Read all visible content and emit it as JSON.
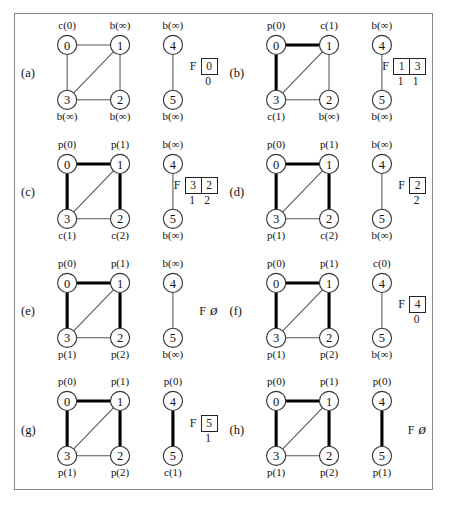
{
  "figure": {
    "caption": "",
    "panels": [
      {
        "tag": "(a)",
        "main_component": {
          "nodes": [
            {
              "id": "0",
              "label": "0",
              "state": "c(0)",
              "state_pos": "top"
            },
            {
              "id": "1",
              "label": "1",
              "state": "b(∞)",
              "state_pos": "top"
            },
            {
              "id": "3",
              "label": "3",
              "state": "b(∞)",
              "state_pos": "bottom"
            },
            {
              "id": "2",
              "label": "2",
              "state": "b(∞)",
              "state_pos": "bottom"
            }
          ],
          "edges": [
            {
              "from": "0",
              "to": "1",
              "bold": false
            },
            {
              "from": "0",
              "to": "3",
              "bold": false
            },
            {
              "from": "1",
              "to": "3",
              "bold": false
            },
            {
              "from": "1",
              "to": "2",
              "bold": false
            },
            {
              "from": "3",
              "to": "2",
              "bold": false
            }
          ]
        },
        "second_component": {
          "nodes": [
            {
              "id": "4",
              "label": "4",
              "state": "b(∞)",
              "state_pos": "top"
            },
            {
              "id": "5",
              "label": "5",
              "state": "b(∞)",
              "state_pos": "bottom"
            }
          ],
          "edges": [
            {
              "from": "4",
              "to": "5",
              "bold": false
            }
          ]
        },
        "queue": {
          "letter": "F",
          "empty": false,
          "cells": [
            "0"
          ],
          "sub": [
            "0"
          ]
        }
      },
      {
        "tag": "(b)",
        "main_component": {
          "nodes": [
            {
              "id": "0",
              "label": "0",
              "state": "p(0)",
              "state_pos": "top"
            },
            {
              "id": "1",
              "label": "1",
              "state": "c(1)",
              "state_pos": "top"
            },
            {
              "id": "3",
              "label": "3",
              "state": "c(1)",
              "state_pos": "bottom"
            },
            {
              "id": "2",
              "label": "2",
              "state": "b(∞)",
              "state_pos": "bottom"
            }
          ],
          "edges": [
            {
              "from": "0",
              "to": "1",
              "bold": true
            },
            {
              "from": "0",
              "to": "3",
              "bold": true
            },
            {
              "from": "1",
              "to": "3",
              "bold": false
            },
            {
              "from": "1",
              "to": "2",
              "bold": false
            },
            {
              "from": "3",
              "to": "2",
              "bold": false
            }
          ]
        },
        "second_component": {
          "nodes": [
            {
              "id": "4",
              "label": "4",
              "state": "b(∞)",
              "state_pos": "top"
            },
            {
              "id": "5",
              "label": "5",
              "state": "b(∞)",
              "state_pos": "bottom"
            }
          ],
          "edges": [
            {
              "from": "4",
              "to": "5",
              "bold": false
            }
          ]
        },
        "queue": {
          "letter": "F",
          "empty": false,
          "cells": [
            "1",
            "3"
          ],
          "sub": [
            "1",
            "1"
          ]
        }
      },
      {
        "tag": "(c)",
        "main_component": {
          "nodes": [
            {
              "id": "0",
              "label": "0",
              "state": "p(0)",
              "state_pos": "top"
            },
            {
              "id": "1",
              "label": "1",
              "state": "p(1)",
              "state_pos": "top"
            },
            {
              "id": "3",
              "label": "3",
              "state": "c(1)",
              "state_pos": "bottom"
            },
            {
              "id": "2",
              "label": "2",
              "state": "c(2)",
              "state_pos": "bottom"
            }
          ],
          "edges": [
            {
              "from": "0",
              "to": "1",
              "bold": true
            },
            {
              "from": "0",
              "to": "3",
              "bold": true
            },
            {
              "from": "1",
              "to": "3",
              "bold": false
            },
            {
              "from": "1",
              "to": "2",
              "bold": true
            },
            {
              "from": "3",
              "to": "2",
              "bold": false
            }
          ]
        },
        "second_component": {
          "nodes": [
            {
              "id": "4",
              "label": "4",
              "state": "b(∞)",
              "state_pos": "top"
            },
            {
              "id": "5",
              "label": "5",
              "state": "b(∞)",
              "state_pos": "bottom"
            }
          ],
          "edges": [
            {
              "from": "4",
              "to": "5",
              "bold": false
            }
          ]
        },
        "queue": {
          "letter": "F",
          "empty": false,
          "cells": [
            "3",
            "2"
          ],
          "sub": [
            "1",
            "2"
          ]
        }
      },
      {
        "tag": "(d)",
        "main_component": {
          "nodes": [
            {
              "id": "0",
              "label": "0",
              "state": "p(0)",
              "state_pos": "top"
            },
            {
              "id": "1",
              "label": "1",
              "state": "p(1)",
              "state_pos": "top"
            },
            {
              "id": "3",
              "label": "3",
              "state": "p(1)",
              "state_pos": "bottom"
            },
            {
              "id": "2",
              "label": "2",
              "state": "c(2)",
              "state_pos": "bottom"
            }
          ],
          "edges": [
            {
              "from": "0",
              "to": "1",
              "bold": true
            },
            {
              "from": "0",
              "to": "3",
              "bold": true
            },
            {
              "from": "1",
              "to": "3",
              "bold": false
            },
            {
              "from": "1",
              "to": "2",
              "bold": true
            },
            {
              "from": "3",
              "to": "2",
              "bold": false
            }
          ]
        },
        "second_component": {
          "nodes": [
            {
              "id": "4",
              "label": "4",
              "state": "b(∞)",
              "state_pos": "top"
            },
            {
              "id": "5",
              "label": "5",
              "state": "b(∞)",
              "state_pos": "bottom"
            }
          ],
          "edges": [
            {
              "from": "4",
              "to": "5",
              "bold": false
            }
          ]
        },
        "queue": {
          "letter": "F",
          "empty": false,
          "cells": [
            "2"
          ],
          "sub": [
            "2"
          ]
        }
      },
      {
        "tag": "(e)",
        "main_component": {
          "nodes": [
            {
              "id": "0",
              "label": "0",
              "state": "p(0)",
              "state_pos": "top"
            },
            {
              "id": "1",
              "label": "1",
              "state": "p(1)",
              "state_pos": "top"
            },
            {
              "id": "3",
              "label": "3",
              "state": "p(1)",
              "state_pos": "bottom"
            },
            {
              "id": "2",
              "label": "2",
              "state": "p(2)",
              "state_pos": "bottom"
            }
          ],
          "edges": [
            {
              "from": "0",
              "to": "1",
              "bold": true
            },
            {
              "from": "0",
              "to": "3",
              "bold": true
            },
            {
              "from": "1",
              "to": "3",
              "bold": false
            },
            {
              "from": "1",
              "to": "2",
              "bold": true
            },
            {
              "from": "3",
              "to": "2",
              "bold": false
            }
          ]
        },
        "second_component": {
          "nodes": [
            {
              "id": "4",
              "label": "4",
              "state": "b(∞)",
              "state_pos": "top"
            },
            {
              "id": "5",
              "label": "5",
              "state": "b(∞)",
              "state_pos": "bottom"
            }
          ],
          "edges": [
            {
              "from": "4",
              "to": "5",
              "bold": false
            }
          ]
        },
        "queue": {
          "letter": "F",
          "empty": true,
          "cells": [],
          "sub": []
        }
      },
      {
        "tag": "(f)",
        "main_component": {
          "nodes": [
            {
              "id": "0",
              "label": "0",
              "state": "p(0)",
              "state_pos": "top"
            },
            {
              "id": "1",
              "label": "1",
              "state": "p(1)",
              "state_pos": "top"
            },
            {
              "id": "3",
              "label": "3",
              "state": "p(1)",
              "state_pos": "bottom"
            },
            {
              "id": "2",
              "label": "2",
              "state": "p(2)",
              "state_pos": "bottom"
            }
          ],
          "edges": [
            {
              "from": "0",
              "to": "1",
              "bold": true
            },
            {
              "from": "0",
              "to": "3",
              "bold": true
            },
            {
              "from": "1",
              "to": "3",
              "bold": false
            },
            {
              "from": "1",
              "to": "2",
              "bold": true
            },
            {
              "from": "3",
              "to": "2",
              "bold": false
            }
          ]
        },
        "second_component": {
          "nodes": [
            {
              "id": "4",
              "label": "4",
              "state": "c(0)",
              "state_pos": "top"
            },
            {
              "id": "5",
              "label": "5",
              "state": "b(∞)",
              "state_pos": "bottom"
            }
          ],
          "edges": [
            {
              "from": "4",
              "to": "5",
              "bold": false
            }
          ]
        },
        "queue": {
          "letter": "F",
          "empty": false,
          "cells": [
            "4"
          ],
          "sub": [
            "0"
          ]
        }
      },
      {
        "tag": "(g)",
        "main_component": {
          "nodes": [
            {
              "id": "0",
              "label": "0",
              "state": "p(0)",
              "state_pos": "top"
            },
            {
              "id": "1",
              "label": "1",
              "state": "p(1)",
              "state_pos": "top"
            },
            {
              "id": "3",
              "label": "3",
              "state": "p(1)",
              "state_pos": "bottom"
            },
            {
              "id": "2",
              "label": "2",
              "state": "p(2)",
              "state_pos": "bottom"
            }
          ],
          "edges": [
            {
              "from": "0",
              "to": "1",
              "bold": true
            },
            {
              "from": "0",
              "to": "3",
              "bold": true
            },
            {
              "from": "1",
              "to": "3",
              "bold": false
            },
            {
              "from": "1",
              "to": "2",
              "bold": true
            },
            {
              "from": "3",
              "to": "2",
              "bold": false
            }
          ]
        },
        "second_component": {
          "nodes": [
            {
              "id": "4",
              "label": "4",
              "state": "p(0)",
              "state_pos": "top"
            },
            {
              "id": "5",
              "label": "5",
              "state": "c(1)",
              "state_pos": "bottom"
            }
          ],
          "edges": [
            {
              "from": "4",
              "to": "5",
              "bold": true
            }
          ]
        },
        "queue": {
          "letter": "F",
          "empty": false,
          "cells": [
            "5"
          ],
          "sub": [
            "1"
          ]
        }
      },
      {
        "tag": "(h)",
        "main_component": {
          "nodes": [
            {
              "id": "0",
              "label": "0",
              "state": "p(0)",
              "state_pos": "top"
            },
            {
              "id": "1",
              "label": "1",
              "state": "p(1)",
              "state_pos": "top"
            },
            {
              "id": "3",
              "label": "3",
              "state": "p(1)",
              "state_pos": "bottom"
            },
            {
              "id": "2",
              "label": "2",
              "state": "p(2)",
              "state_pos": "bottom"
            }
          ],
          "edges": [
            {
              "from": "0",
              "to": "1",
              "bold": true
            },
            {
              "from": "0",
              "to": "3",
              "bold": true
            },
            {
              "from": "1",
              "to": "3",
              "bold": false
            },
            {
              "from": "1",
              "to": "2",
              "bold": true
            },
            {
              "from": "3",
              "to": "2",
              "bold": false
            }
          ]
        },
        "second_component": {
          "nodes": [
            {
              "id": "4",
              "label": "4",
              "state": "p(0)",
              "state_pos": "top"
            },
            {
              "id": "5",
              "label": "5",
              "state": "p(1)",
              "state_pos": "bottom"
            }
          ],
          "edges": [
            {
              "from": "4",
              "to": "5",
              "bold": true
            }
          ]
        },
        "queue": {
          "letter": "F",
          "empty": true,
          "cells": [],
          "sub": []
        }
      }
    ]
  }
}
